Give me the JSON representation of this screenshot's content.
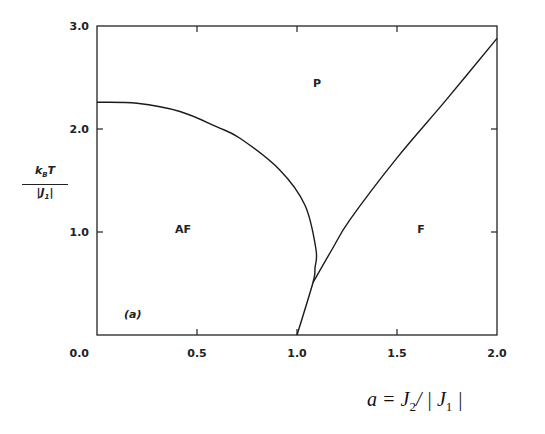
{
  "chart_data": {
    "type": "line",
    "title": "",
    "xlabel": "a = J₂/ | J₁ |",
    "ylabel": "k_B T / |J_1|",
    "xlim": [
      0.0,
      2.0
    ],
    "ylim": [
      0.0,
      3.0
    ],
    "x_ticks": [
      "0.0",
      "0.5",
      "1.0",
      "1.5",
      "2.0"
    ],
    "y_ticks": [
      "1.0",
      "2.0",
      "3.0"
    ],
    "y_zero_label": "0.0",
    "grid": false,
    "panel_label": "(a)",
    "region_labels": [
      {
        "text": "P",
        "x": 1.1,
        "y": 2.45
      },
      {
        "text": "AF",
        "x": 0.43,
        "y": 1.03
      },
      {
        "text": "F",
        "x": 1.62,
        "y": 1.03
      }
    ],
    "series": [
      {
        "name": "AF-P boundary",
        "x": [
          0.0,
          0.2,
          0.415,
          0.6,
          0.715,
          0.915,
          1.04,
          1.095,
          1.09,
          1.08,
          1.0
        ],
        "y": [
          2.26,
          2.25,
          2.17,
          2.02,
          1.91,
          1.6,
          1.26,
          0.83,
          0.65,
          0.51,
          0.0
        ]
      },
      {
        "name": "F-P boundary",
        "x": [
          1.08,
          1.175,
          1.265,
          1.5,
          1.745,
          2.0
        ],
        "y": [
          0.51,
          0.83,
          1.12,
          1.72,
          2.28,
          2.88
        ]
      }
    ]
  },
  "labels": {
    "y_num": "k",
    "y_num_sub": "B",
    "y_num_T": "T",
    "y_den": "|J",
    "y_den_sub": "1",
    "y_den_end": "|",
    "x_axis_a": "a = J",
    "x_axis_sub2": "2",
    "x_axis_mid": "/ | J",
    "x_axis_sub1": "1",
    "x_axis_end": " |"
  }
}
